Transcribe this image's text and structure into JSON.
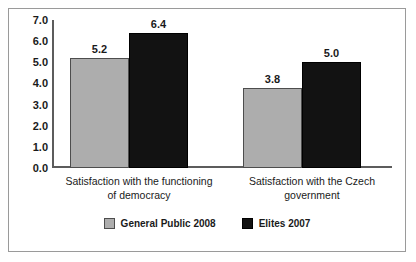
{
  "chart_data": {
    "type": "bar",
    "title": "",
    "subtitle": "",
    "xlabel": "",
    "ylabel": "",
    "ylim": [
      0.0,
      7.0
    ],
    "grid": false,
    "legend_position": "bottom-center",
    "categories": [
      "Satisfaction with the functioning of democracy",
      "Satisfaction with the Czech government"
    ],
    "category_lines": [
      [
        "Satisfaction with the functioning",
        "of democracy"
      ],
      [
        "Satisfaction with the Czech",
        "government"
      ]
    ],
    "series": [
      {
        "name": "General Public 2008",
        "color": "#adadad",
        "values": [
          5.2,
          3.8
        ],
        "value_labels": [
          "5.2",
          "3.8"
        ]
      },
      {
        "name": "Elites 2007",
        "color": "#121212",
        "values": [
          6.4,
          5.0
        ],
        "value_labels": [
          "6.4",
          "5.0"
        ]
      }
    ],
    "y_ticks": [
      7.0,
      6.0,
      5.0,
      4.0,
      3.0,
      2.0,
      1.0,
      0.0
    ],
    "y_tick_labels": [
      "7.0",
      "6.0",
      "5.0",
      "4.0",
      "3.0",
      "2.0",
      "1.0",
      "0.0"
    ]
  },
  "legend": {
    "entries": [
      {
        "label": "General Public 2008",
        "swatch": "light"
      },
      {
        "label": "Elites 2007",
        "swatch": "dark"
      }
    ]
  }
}
